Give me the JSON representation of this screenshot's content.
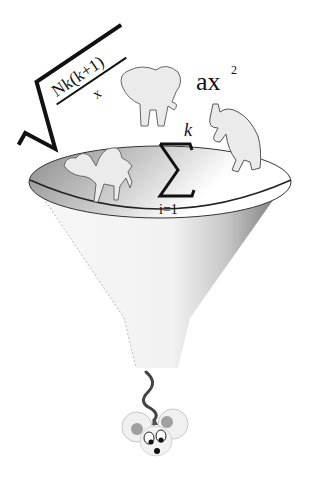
{
  "illustration": {
    "subject": "data funnel",
    "formulas": {
      "sqrt_numerator": "Nk(k+1)",
      "sqrt_denominator": "x",
      "sum_upper": "k",
      "sum_lower": "i=1",
      "sum_symbol": "Σ",
      "poly_base": "ax",
      "poly_exponent": "2"
    },
    "animals": [
      "elephant-icon",
      "camel-icon",
      "rhino-icon",
      "mouse-icon"
    ],
    "colors": {
      "funnel_dark": "#8a8a8a",
      "funnel_light": "#f2f2f2",
      "animal_fill": "#ebebeb",
      "outline": "#555555",
      "mouse_ear_inner": "#9a9a9a",
      "tail": "#444444"
    }
  }
}
